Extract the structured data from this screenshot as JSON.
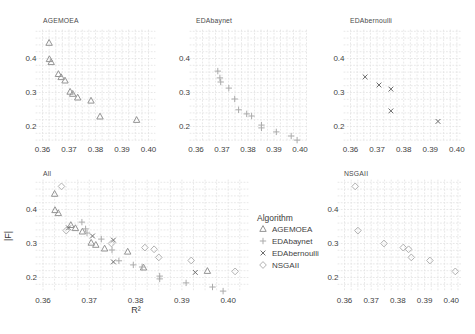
{
  "figure": {
    "xlabel": "R²",
    "ylabel": "|F|",
    "x_ticks": [
      0.36,
      0.37,
      0.38,
      0.39,
      0.4
    ],
    "x_tick_labels": [
      "0.36",
      "0.37",
      "0.38",
      "0.39",
      "0.40"
    ],
    "y_ticks": [
      0.4,
      0.3,
      0.2
    ],
    "y_tick_labels": [
      "0.4",
      "0.3",
      "0.2"
    ],
    "xlim": [
      0.3575,
      0.4035
    ],
    "ylim": [
      0.155,
      0.485
    ],
    "grid": "dotted-minor",
    "colors": {
      "triangle": "#949494",
      "plus": "#ababab",
      "cross": "#6e6e6e",
      "diamond": "#b2b2b2",
      "text": "#3f3f3f",
      "grid": "#e2e2e2",
      "background": "#ffffff"
    }
  },
  "legend": {
    "title": "Algorithm",
    "items": [
      {
        "label": "AGEMOEA",
        "marker": "triangle"
      },
      {
        "label": "EDAbaynet",
        "marker": "plus"
      },
      {
        "label": "EDAbernoulli",
        "marker": "cross"
      },
      {
        "label": "NSGAII",
        "marker": "diamond"
      }
    ]
  },
  "chart_data": [
    {
      "type": "scatter",
      "title": "AGEMOEA",
      "marker": "triangle",
      "points": [
        [
          0.3625,
          0.446
        ],
        [
          0.3626,
          0.398
        ],
        [
          0.3633,
          0.389
        ],
        [
          0.366,
          0.354
        ],
        [
          0.367,
          0.345
        ],
        [
          0.3685,
          0.335
        ],
        [
          0.3704,
          0.302
        ],
        [
          0.3714,
          0.296
        ],
        [
          0.3733,
          0.285
        ],
        [
          0.3783,
          0.276
        ],
        [
          0.3817,
          0.229
        ],
        [
          0.3955,
          0.219
        ]
      ]
    },
    {
      "type": "scatter",
      "title": "EDAbaynet",
      "marker": "plus",
      "points": [
        [
          0.3684,
          0.363
        ],
        [
          0.3692,
          0.343
        ],
        [
          0.3695,
          0.331
        ],
        [
          0.3726,
          0.313
        ],
        [
          0.3749,
          0.281
        ],
        [
          0.3764,
          0.249
        ],
        [
          0.3795,
          0.237
        ],
        [
          0.3814,
          0.231
        ],
        [
          0.3852,
          0.204
        ],
        [
          0.3852,
          0.196
        ],
        [
          0.3909,
          0.184
        ],
        [
          0.3966,
          0.172
        ],
        [
          0.3989,
          0.16
        ]
      ]
    },
    {
      "type": "scatter",
      "title": "EDAbernoulli",
      "marker": "cross",
      "points": [
        [
          0.3655,
          0.346
        ],
        [
          0.3707,
          0.322
        ],
        [
          0.3752,
          0.31
        ],
        [
          0.3752,
          0.246
        ],
        [
          0.3929,
          0.215
        ]
      ]
    },
    {
      "type": "scatter",
      "title": "All",
      "xlabel": "R²",
      "ylabel": "|F|",
      "series": [
        {
          "name": "AGEMOEA",
          "marker": "triangle",
          "points": [
            [
              0.3625,
              0.446
            ],
            [
              0.3626,
              0.398
            ],
            [
              0.3633,
              0.389
            ],
            [
              0.366,
              0.354
            ],
            [
              0.367,
              0.345
            ],
            [
              0.3685,
              0.335
            ],
            [
              0.3704,
              0.302
            ],
            [
              0.3714,
              0.296
            ],
            [
              0.3733,
              0.285
            ],
            [
              0.3783,
              0.276
            ],
            [
              0.3817,
              0.229
            ],
            [
              0.3955,
              0.219
            ]
          ]
        },
        {
          "name": "EDAbaynet",
          "marker": "plus",
          "points": [
            [
              0.3684,
              0.363
            ],
            [
              0.3692,
              0.343
            ],
            [
              0.3695,
              0.331
            ],
            [
              0.3726,
              0.313
            ],
            [
              0.3749,
              0.281
            ],
            [
              0.3764,
              0.249
            ],
            [
              0.3795,
              0.237
            ],
            [
              0.3814,
              0.231
            ],
            [
              0.3852,
              0.204
            ],
            [
              0.3852,
              0.196
            ],
            [
              0.3909,
              0.184
            ],
            [
              0.3966,
              0.172
            ],
            [
              0.3989,
              0.16
            ]
          ]
        },
        {
          "name": "EDAbernoulli",
          "marker": "cross",
          "points": [
            [
              0.3655,
              0.346
            ],
            [
              0.3707,
              0.322
            ],
            [
              0.3752,
              0.31
            ],
            [
              0.3752,
              0.246
            ],
            [
              0.3929,
              0.215
            ]
          ]
        },
        {
          "name": "NSGAII",
          "marker": "diamond",
          "points": [
            [
              0.364,
              0.468
            ],
            [
              0.365,
              0.338
            ],
            [
              0.3748,
              0.3
            ],
            [
              0.382,
              0.288
            ],
            [
              0.384,
              0.283
            ],
            [
              0.385,
              0.259
            ],
            [
              0.392,
              0.25
            ],
            [
              0.4015,
              0.218
            ]
          ]
        }
      ]
    },
    {
      "type": "scatter",
      "title": "NSGAII",
      "marker": "diamond",
      "points": [
        [
          0.364,
          0.468
        ],
        [
          0.365,
          0.338
        ],
        [
          0.3748,
          0.3
        ],
        [
          0.382,
          0.288
        ],
        [
          0.384,
          0.283
        ],
        [
          0.385,
          0.259
        ],
        [
          0.392,
          0.25
        ],
        [
          0.4015,
          0.218
        ]
      ]
    }
  ]
}
